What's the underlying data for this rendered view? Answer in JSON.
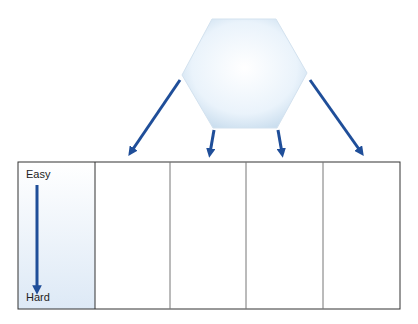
{
  "diagram": {
    "scale_labels": {
      "top": "Easy",
      "bottom": "Hard"
    },
    "columns": 5,
    "colors": {
      "arrow": "#1f4e99",
      "hexagon_fill": "#e6f1fa",
      "scale_column_fill": "#eaf3fb",
      "border": "#333333"
    }
  }
}
